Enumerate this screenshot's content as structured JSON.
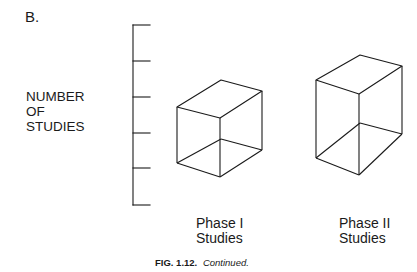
{
  "panel_label": "B.",
  "y_axis": {
    "label_lines": [
      "NUMBER",
      "OF",
      "STUDIES"
    ],
    "tick_count": 6
  },
  "categories": [
    {
      "lines": [
        "Phase I",
        "Studies"
      ]
    },
    {
      "lines": [
        "Phase II",
        "Studies"
      ]
    }
  ],
  "caption": {
    "number": "FIG. 1.12.",
    "text": "Continued."
  },
  "colors": {
    "line": "#1a1a1a",
    "background": "#ffffff"
  }
}
